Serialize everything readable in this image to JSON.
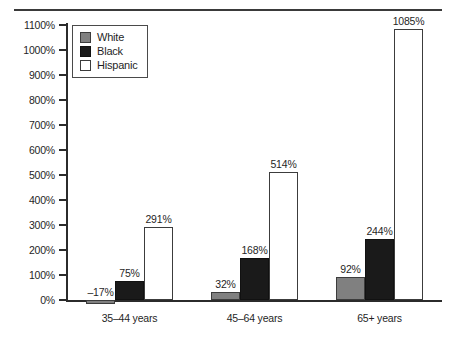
{
  "chart_data": {
    "type": "bar",
    "title": "",
    "subtitle": "",
    "xlabel": "",
    "ylabel": "",
    "categories": [
      "35–44 years",
      "45–64 years",
      "65+ years"
    ],
    "series": [
      {
        "name": "White",
        "values": [
          -17,
          32,
          92
        ],
        "color": "#808080",
        "labels": [
          "–17%",
          "32%",
          "92%"
        ]
      },
      {
        "name": "Black",
        "values": [
          75,
          168,
          244
        ],
        "color": "#1a1a1a",
        "labels": [
          "75%",
          "168%",
          "244%"
        ]
      },
      {
        "name": "Hispanic",
        "values": [
          291,
          514,
          1085
        ],
        "color": "#ffffff",
        "labels": [
          "291%",
          "514%",
          "1085%"
        ]
      }
    ],
    "ylim": [
      0,
      1100
    ],
    "ytick_values": [
      0,
      100,
      200,
      300,
      400,
      500,
      600,
      700,
      800,
      900,
      1000,
      1100
    ],
    "ytick_labels": [
      "0%",
      "100%",
      "200%",
      "300%",
      "400%",
      "500%",
      "600%",
      "700%",
      "800%",
      "900%",
      "1000%",
      "1100%"
    ],
    "grid": false,
    "legend_position": "top-left",
    "legend_entries": [
      "White",
      "Black",
      "Hispanic"
    ]
  },
  "axis": {
    "ticks": [
      {
        "label": "1100%",
        "value": 1100
      },
      {
        "label": "1000%",
        "value": 1000
      },
      {
        "label": "900%",
        "value": 900
      },
      {
        "label": "800%",
        "value": 800
      },
      {
        "label": "700%",
        "value": 700
      },
      {
        "label": "600%",
        "value": 600
      },
      {
        "label": "500%",
        "value": 500
      },
      {
        "label": "400%",
        "value": 400
      },
      {
        "label": "300%",
        "value": 300
      },
      {
        "label": "200%",
        "value": 200
      },
      {
        "label": "100%",
        "value": 100
      },
      {
        "label": "0%",
        "value": 0
      }
    ]
  },
  "legend": {
    "items": [
      {
        "label": "White",
        "swatch": "gray-swatch-icon"
      },
      {
        "label": "Black",
        "swatch": "black-swatch-icon"
      },
      {
        "label": "Hispanic",
        "swatch": "white-swatch-icon"
      }
    ]
  },
  "groups": [
    {
      "label": "35–44 years",
      "bars": [
        {
          "series": "White",
          "label": "–17%",
          "value": -17
        },
        {
          "series": "Black",
          "label": "75%",
          "value": 75
        },
        {
          "series": "Hispanic",
          "label": "291%",
          "value": 291
        }
      ]
    },
    {
      "label": "45–64 years",
      "bars": [
        {
          "series": "White",
          "label": "32%",
          "value": 32
        },
        {
          "series": "Black",
          "label": "168%",
          "value": 168
        },
        {
          "series": "Hispanic",
          "label": "514%",
          "value": 514
        }
      ]
    },
    {
      "label": "65+ years",
      "bars": [
        {
          "series": "White",
          "label": "92%",
          "value": 92
        },
        {
          "series": "Black",
          "label": "244%",
          "value": 244
        },
        {
          "series": "Hispanic",
          "label": "1085%",
          "value": 1085
        }
      ]
    }
  ]
}
